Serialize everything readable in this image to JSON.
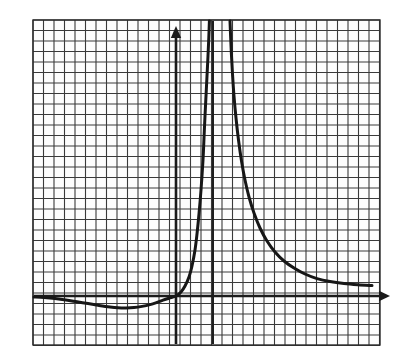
{
  "figure": {
    "title": "Graph of a rational function with a vertical asymptote",
    "background_color": "#ffffff",
    "width": 404,
    "height": 360
  },
  "grid": {
    "left": 33,
    "top": 20,
    "right": 380,
    "bottom": 345,
    "cell_size": 10.5,
    "columns": 33,
    "rows": 31,
    "line_color": "#3a3a3a",
    "line_width": 1.1,
    "border_color": "#2b2b2b",
    "border_width": 1.4,
    "grid_on": true,
    "tick_labels_shown": false,
    "axis_labels_shown": false
  },
  "axes": {
    "x_axis": {
      "name": "x-axis",
      "pixel_y": 296,
      "pixel_x_start": 34,
      "pixel_x_end": 390,
      "color": "#1a1a1a",
      "line_width": 2.6,
      "arrow": "right",
      "arrow_label": "arrow-right"
    },
    "y_axis": {
      "name": "y-axis",
      "pixel_x": 176,
      "pixel_y_start": 344,
      "pixel_y_end": 26,
      "color": "#1a1a1a",
      "line_width": 2.6,
      "arrow": "up",
      "arrow_label": "arrow-up"
    },
    "origin": {
      "x": 176,
      "y": 296
    }
  },
  "asymptote": {
    "name": "vertical-asymptote",
    "pixel_x": 213,
    "pixel_y_start": 21,
    "pixel_y_end": 344,
    "color": "#1f1f1f",
    "line_width": 2.0,
    "orientation": "vertical",
    "grid_units_right_of_y_axis": 3.5
  },
  "chart_data": {
    "type": "line",
    "title": "Graph of a rational function with a vertical asymptote",
    "subtitle": "",
    "xlabel": "",
    "ylabel": "",
    "grid": true,
    "legend_position": "none",
    "xlim": [
      -13.6,
      19.4
    ],
    "ylim": [
      -4.7,
      26.3
    ],
    "axis_units_per_cell": 1,
    "annotations": [
      "vertical asymptote at x = 3.5 grid units right of the y-axis",
      "horizontal asymptote y = 0 (the x-axis) on both far ends",
      "local minimum below the x-axis left of the origin",
      "curve passes through the origin"
    ],
    "features": {
      "x_intercept_grid_units": 0,
      "y_intercept_grid_units": 0,
      "local_minimum_grid_units": {
        "x": -5.5,
        "y": -1.15
      },
      "left_edge_value_grid_units": {
        "x": -13.6,
        "y": -0.1
      },
      "right_edge_value_grid_units": {
        "x": 18.7,
        "y": 1.05
      }
    },
    "series": [
      {
        "name": "left-branch",
        "description": "enters from the left just below y=0, dips to a minimum, rises through the origin and diverges to +infinity at the asymptote",
        "points_px": [
          [
            34,
            297.0
          ],
          [
            44,
            297.6
          ],
          [
            55,
            298.6
          ],
          [
            66,
            300.0
          ],
          [
            77,
            301.8
          ],
          [
            88,
            303.6
          ],
          [
            99,
            305.4
          ],
          [
            110,
            307.0
          ],
          [
            118,
            307.8
          ],
          [
            126,
            308.0
          ],
          [
            134,
            307.6
          ],
          [
            142,
            306.4
          ],
          [
            150,
            304.6
          ],
          [
            157,
            302.4
          ],
          [
            163,
            300.2
          ],
          [
            169,
            298.2
          ],
          [
            176,
            296.0
          ],
          [
            181,
            292.0
          ],
          [
            185,
            286.0
          ],
          [
            189,
            277.0
          ],
          [
            192,
            266.0
          ],
          [
            195,
            250.0
          ],
          [
            197,
            234.0
          ],
          [
            199,
            214.0
          ],
          [
            201,
            190.0
          ],
          [
            203,
            160.0
          ],
          [
            204,
            138.0
          ],
          [
            205,
            116.0
          ],
          [
            206,
            96.0
          ],
          [
            207,
            76.0
          ],
          [
            208,
            56.0
          ],
          [
            208.8,
            38.0
          ],
          [
            209.4,
            21.0
          ]
        ]
      },
      {
        "name": "right-branch",
        "description": "descends from +infinity just right of the asymptote and decays toward the x-axis on the right",
        "points_px": [
          [
            230.0,
            21.0
          ],
          [
            230.6,
            36.0
          ],
          [
            231.4,
            54.0
          ],
          [
            232.5,
            74.0
          ],
          [
            234.0,
            96.0
          ],
          [
            236.0,
            118.0
          ],
          [
            238.5,
            140.0
          ],
          [
            241.5,
            161.0
          ],
          [
            245.0,
            180.0
          ],
          [
            249.0,
            197.0
          ],
          [
            254.0,
            213.0
          ],
          [
            260.0,
            228.0
          ],
          [
            267.0,
            241.0
          ],
          [
            275.0,
            252.0
          ],
          [
            284.0,
            261.0
          ],
          [
            294.0,
            268.0
          ],
          [
            305.0,
            274.0
          ],
          [
            317.0,
            278.6
          ],
          [
            330.0,
            281.6
          ],
          [
            344.0,
            283.6
          ],
          [
            358.0,
            284.8
          ],
          [
            372.0,
            285.6
          ]
        ]
      }
    ],
    "curve_style": {
      "color": "#161616",
      "line_width": 3.0,
      "fill": "none"
    }
  }
}
